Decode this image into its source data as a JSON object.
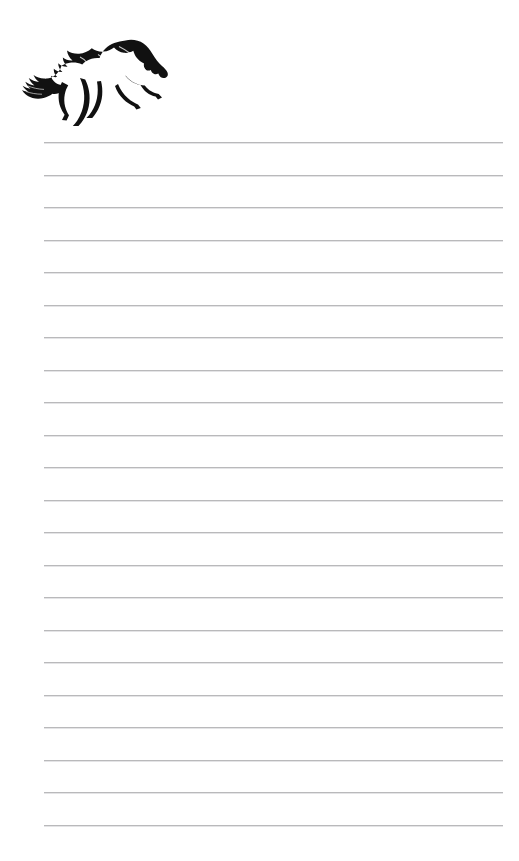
{
  "page": {
    "kind": "lined-writing-paper",
    "width": 519,
    "height": 861,
    "background_color": "#ffffff",
    "text_content": ""
  },
  "artwork": {
    "name": "galloping-horse-silhouette",
    "description": "Black silhouette of a galloping horse facing right with flowing mane and tail",
    "fill_color": "#111111",
    "left": 22,
    "top": 34,
    "width": 150,
    "height": 98
  },
  "rules": {
    "line_color": "#b9b9bb",
    "line_shadow_color": "#e4e4e6",
    "left": 44,
    "right": 503,
    "line_width": 459,
    "first_line_y": 142,
    "spacing": 32.5,
    "count": 22,
    "y_positions": [
      142,
      174.5,
      207,
      239.5,
      272,
      304.5,
      337,
      369.5,
      402,
      434.5,
      467,
      499.5,
      532,
      564.5,
      597,
      629.5,
      662,
      694.5,
      727,
      759.5,
      792,
      824.5
    ]
  }
}
